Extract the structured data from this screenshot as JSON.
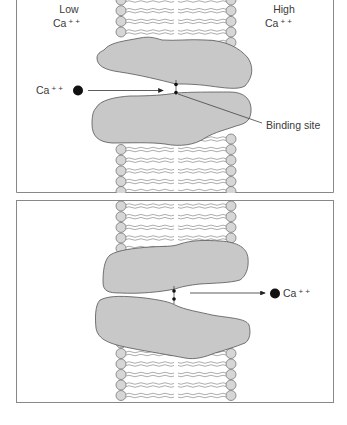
{
  "figure": {
    "panels": [
      {
        "id": "panel-1",
        "labels": {
          "left_top": "Low",
          "left_bottom": "Ca",
          "left_bottom_charge": "+ +",
          "right_top": "High",
          "right_bottom": "Ca",
          "right_bottom_charge": "+ +",
          "ion": "Ca",
          "ion_charge": "+ +",
          "binding_site": "Binding site"
        },
        "ion_direction": "entering from left toward binding site"
      },
      {
        "id": "panel-2",
        "labels": {
          "ion": "Ca",
          "ion_charge": "+ +"
        },
        "ion_direction": "released to right side"
      }
    ],
    "colors": {
      "protein_fill": "#c8c8c8",
      "protein_stroke": "#555555",
      "lipid_head_fill": "#d6d6d6",
      "lipid_head_stroke": "#777777",
      "ion_fill": "#111111",
      "frame": "#888888"
    }
  }
}
